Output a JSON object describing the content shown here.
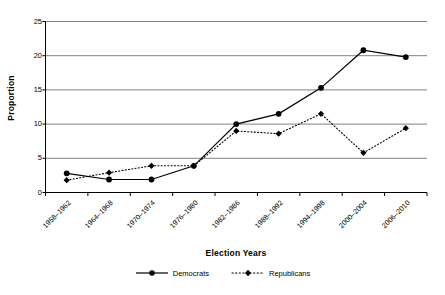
{
  "chart_data": {
    "type": "line",
    "title": "",
    "xlabel": "Election Years",
    "ylabel": "Proportion",
    "categories": [
      "1958–1962",
      "1964–1968",
      "1970–1974",
      "1976–1980",
      "1982–1986",
      "1988–1992",
      "1994–1998",
      "2000–2004",
      "2006–2010"
    ],
    "series": [
      {
        "name": "Democrats",
        "values": [
          2.8,
          1.9,
          1.9,
          3.9,
          10.0,
          11.5,
          15.3,
          20.8,
          19.8
        ],
        "line_style": "solid",
        "marker": "circle",
        "color": "#000000"
      },
      {
        "name": "Republicans",
        "values": [
          1.8,
          2.9,
          3.9,
          3.9,
          9.0,
          8.6,
          11.5,
          5.8,
          9.4
        ],
        "line_style": "dotted",
        "marker": "diamond",
        "color": "#000000"
      }
    ],
    "ylim": [
      0,
      25
    ],
    "yticks": [
      0,
      5,
      10,
      15,
      20,
      25
    ],
    "ytick_labels": [
      "0",
      "5",
      "10",
      "15",
      "20",
      "25"
    ],
    "grid": "horizontal",
    "grid_color": "#808080",
    "axis_color": "#000000",
    "legend_position": "bottom",
    "background": "#ffffff"
  },
  "legend": {
    "entries": [
      {
        "label": "Democrats"
      },
      {
        "label": "Republicans"
      }
    ]
  }
}
